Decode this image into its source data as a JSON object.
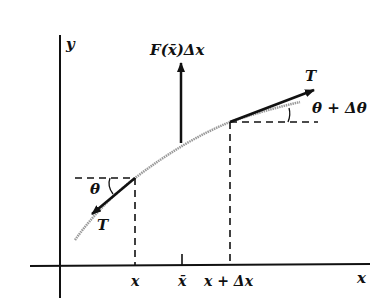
{
  "diagram": {
    "axis_labels": {
      "y": "y",
      "x": "x"
    },
    "force_label": "F(x̄)Δx",
    "tension_left": "T",
    "tension_right": "T",
    "angle_left": "θ",
    "angle_right": "θ + Δθ",
    "tick_labels": {
      "x": "x",
      "xbar": "x̄",
      "x_plus_dx": "x + Δx"
    },
    "colors": {
      "ink": "#111111",
      "curve": "#9a9a9a"
    }
  }
}
